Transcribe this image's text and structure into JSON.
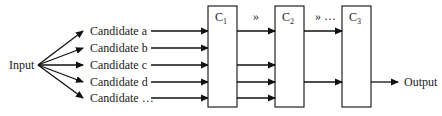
{
  "input": {
    "label": "Input"
  },
  "output": {
    "label": "Output"
  },
  "candidates": [
    {
      "label": "Candidate a"
    },
    {
      "label": "Candidate b"
    },
    {
      "label": "Candidate c"
    },
    {
      "label": "Candidate d"
    },
    {
      "label": "Candidate …"
    }
  ],
  "classifiers": [
    {
      "name": "C",
      "sub": "1"
    },
    {
      "name": "C",
      "sub": "2"
    },
    {
      "name": "C",
      "sub": "3"
    }
  ],
  "between": [
    {
      "label": "»"
    },
    {
      "label": "» …"
    }
  ],
  "connections": {
    "c1_to_c2_rows": [
      1,
      3,
      4,
      5
    ],
    "c2_to_c3_rows": [
      1,
      4
    ],
    "c3_to_output_row": 4
  }
}
